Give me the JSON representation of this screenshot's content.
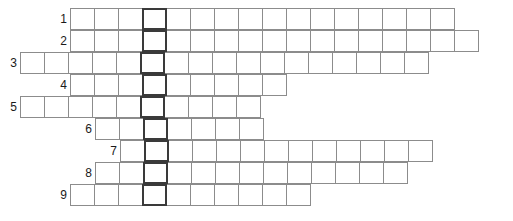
{
  "puzzle": {
    "type": "crossword-skeleton-grid",
    "title": "",
    "row_count": 9,
    "cell_width": 25,
    "cell_height": 22,
    "grid_top": 8,
    "highlight_column_x": 146,
    "colors": {
      "cell_border": "#8c8c8c",
      "highlight_border": "#3a3a3a",
      "cell_fill": "#ffffff",
      "number_text": "#1a1a1a",
      "background": "#ffffff"
    },
    "rows": [
      {
        "number": "1",
        "left": 70,
        "cells": 16,
        "highlight_index": 3
      },
      {
        "number": "2",
        "left": 70,
        "cells": 17,
        "highlight_index": 3
      },
      {
        "number": "3",
        "left": 20,
        "cells": 17,
        "highlight_index": 5
      },
      {
        "number": "4",
        "left": 70,
        "cells": 9,
        "highlight_index": 3
      },
      {
        "number": "5",
        "left": 20,
        "cells": 10,
        "highlight_index": 5
      },
      {
        "number": "6",
        "left": 95,
        "cells": 7,
        "highlight_index": 2
      },
      {
        "number": "7",
        "left": 120,
        "cells": 13,
        "highlight_index": 1
      },
      {
        "number": "8",
        "left": 95,
        "cells": 13,
        "highlight_index": 2
      },
      {
        "number": "9",
        "left": 70,
        "cells": 10,
        "highlight_index": 3
      }
    ]
  }
}
